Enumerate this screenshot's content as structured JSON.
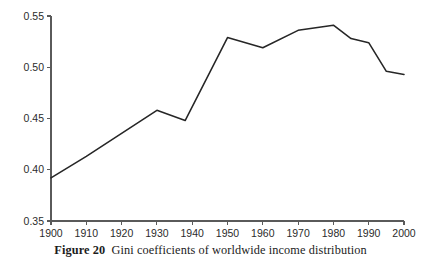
{
  "caption": {
    "label": "Figure 20",
    "text": "Gini coefficients of worldwide income distribution"
  },
  "chart_data": {
    "type": "line",
    "title": "",
    "xlabel": "",
    "ylabel": "",
    "xlim": [
      1900,
      2000
    ],
    "ylim": [
      0.35,
      0.55
    ],
    "grid": false,
    "legend": null,
    "line_color": "#262626",
    "axis_color": "#5a5a5a",
    "xticks": [
      1900,
      1910,
      1920,
      1930,
      1940,
      1950,
      1960,
      1970,
      1980,
      1990,
      2000
    ],
    "xtick_labels": [
      "1900",
      "1910",
      "1920",
      "1930",
      "1940",
      "1950",
      "1960",
      "1970",
      "1980",
      "1990",
      "2000"
    ],
    "yticks": [
      0.35,
      0.4,
      0.45,
      0.5,
      0.55
    ],
    "ytick_labels": [
      "0.35",
      "0.40",
      "0.45",
      "0.50",
      "0.55"
    ],
    "series": [
      {
        "name": "Gini coefficient",
        "x": [
          1900,
          1910,
          1930,
          1938,
          1950,
          1960,
          1970,
          1980,
          1985,
          1990,
          1995,
          2000
        ],
        "values": [
          0.392,
          0.413,
          0.458,
          0.448,
          0.529,
          0.519,
          0.536,
          0.541,
          0.528,
          0.524,
          0.496,
          0.493
        ]
      }
    ]
  }
}
